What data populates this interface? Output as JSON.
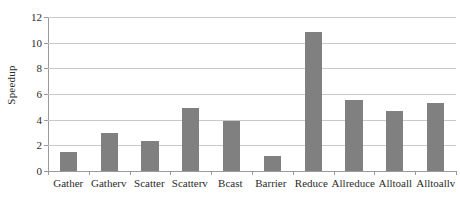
{
  "chart_data": {
    "type": "bar",
    "title": "",
    "xlabel": "",
    "ylabel": "Speedup",
    "categories": [
      "Gather",
      "Gatherv",
      "Scatter",
      "Scatterv",
      "Bcast",
      "Barrier",
      "Reduce",
      "Allreduce",
      "Alltoall",
      "Alltoallv"
    ],
    "values": [
      1.5,
      3.0,
      2.3,
      4.9,
      3.9,
      1.2,
      10.8,
      5.5,
      4.7,
      5.3
    ],
    "ylim": [
      0,
      12
    ],
    "yticks": [
      0,
      2,
      4,
      6,
      8,
      10,
      12
    ],
    "ytick_labels": [
      "0",
      "2",
      "4",
      "6",
      "8",
      "10",
      "12"
    ],
    "grid": true,
    "legend": "none",
    "bar_color": "#808080",
    "grid_color": "#c9c9c9",
    "axis_color": "#9a9a9a",
    "background": "#ffffff"
  }
}
